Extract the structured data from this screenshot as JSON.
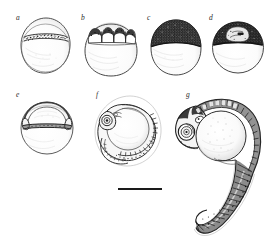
{
  "figure": {
    "kind": "scientific-line-drawing-plate",
    "background_color": "#ffffff",
    "ink_color": "#1a1a1a",
    "label_color": "#2b2b2b",
    "width_px": 277,
    "height_px": 243
  },
  "panels": [
    {
      "id": "a",
      "label": "a",
      "name": "panel-a-blastodisc-egg",
      "description": "egg with dark stippled band near upper pole",
      "label_x": 16,
      "label_y": 15,
      "x": 18,
      "y": 18,
      "width": 52,
      "height": 58
    },
    {
      "id": "b",
      "label": "b",
      "name": "panel-b-cleavage-egg",
      "description": "egg with row of rounded blastomeres at animal pole",
      "label_x": 82,
      "label_y": 15,
      "x": 82,
      "y": 18,
      "width": 54,
      "height": 58
    },
    {
      "id": "c",
      "label": "c",
      "name": "panel-c-blastula-egg",
      "description": "egg capped by dense dark stippled blastoderm",
      "label_x": 148,
      "label_y": 15,
      "x": 148,
      "y": 18,
      "width": 52,
      "height": 58
    },
    {
      "id": "d",
      "label": "d",
      "name": "panel-d-gastrula-egg",
      "description": "egg with dark cap and pale interior patch",
      "label_x": 210,
      "label_y": 15,
      "x": 210,
      "y": 18,
      "width": 52,
      "height": 58
    },
    {
      "id": "e",
      "label": "e",
      "name": "panel-e-germ-ring-egg",
      "description": "egg with arched embryonic shield over equatorial band",
      "label_x": 16,
      "label_y": 93,
      "x": 18,
      "y": 96,
      "width": 54,
      "height": 58
    },
    {
      "id": "f",
      "label": "f",
      "name": "panel-f-segmentation-embryo",
      "description": "embryo encircling yolk sphere with head, eye and somites",
      "label_x": 96,
      "label_y": 93,
      "x": 92,
      "y": 96,
      "width": 72,
      "height": 80
    },
    {
      "id": "g",
      "label": "g",
      "name": "panel-g-hatched-larva",
      "description": "larva with pigmented head, eye, round yolk sac and long segmented curving tail",
      "label_x": 188,
      "label_y": 93,
      "x": 170,
      "y": 96,
      "width": 104,
      "height": 142
    }
  ],
  "scale_bar": {
    "name": "scale-bar",
    "x": 118,
    "y": 188,
    "length_px": 44,
    "thickness_px": 2,
    "color": "#1a1a1a",
    "label": ""
  }
}
